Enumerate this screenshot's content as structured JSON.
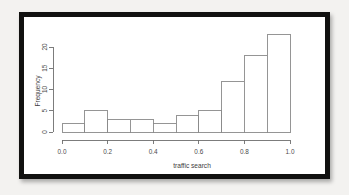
{
  "figure": {
    "kind": "histogram-figure",
    "frame_color": "#111110",
    "page_background": "#f3f2f0",
    "plot_background": "#ffffff"
  },
  "chart_data": {
    "type": "bar",
    "title": "",
    "subtitle": "",
    "xlabel": "traffic search",
    "ylabel": "Frequency",
    "grid": false,
    "legend": null,
    "bin_width": 0.1,
    "bin_edges": [
      0.0,
      0.1,
      0.2,
      0.3,
      0.4,
      0.5,
      0.6,
      0.7,
      0.8,
      0.9,
      1.0
    ],
    "categories": [
      "0.0-0.1",
      "0.1-0.2",
      "0.2-0.3",
      "0.3-0.4",
      "0.4-0.5",
      "0.5-0.6",
      "0.6-0.7",
      "0.7-0.8",
      "0.8-0.9",
      "0.9-1.0"
    ],
    "values": [
      2,
      5,
      3,
      3,
      2,
      4,
      5,
      12,
      18,
      23
    ],
    "xlim": [
      0.0,
      1.0
    ],
    "ylim": [
      0,
      20
    ],
    "xticks": [
      0.0,
      0.2,
      0.4,
      0.6,
      0.8,
      1.0
    ],
    "xtick_labels": [
      "0.0",
      "0.2",
      "0.4",
      "0.6",
      "0.8",
      "1.0"
    ],
    "yticks": [
      0,
      5,
      10,
      15,
      20
    ],
    "ytick_labels": [
      "0",
      "5",
      "10",
      "15",
      "20"
    ],
    "bar_fill": "#ffffff",
    "bar_stroke": "#8a8a8a",
    "axis_color": "#6e6e6e"
  }
}
